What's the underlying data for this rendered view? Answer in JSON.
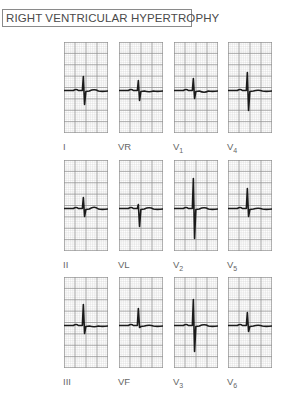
{
  "title": "RIGHT VENTRICULAR HYPERTROPHY",
  "colors": {
    "grid_minor": "#d6d6d6",
    "grid_major": "#8e8e8e",
    "trace": "#1a1a1a",
    "border": "#8a8a8a"
  },
  "layout": {
    "columns_x": [
      64,
      119,
      174,
      228
    ],
    "rows_y": [
      42,
      160,
      277
    ],
    "panel_width": 44,
    "panel_height": 91,
    "label_offset_y": 101
  },
  "leads": [
    {
      "id": "I",
      "label": "I",
      "sub": "",
      "row": 0,
      "col": 0,
      "r": 14,
      "s": 14,
      "t": 2
    },
    {
      "id": "VR",
      "label": "VR",
      "sub": "",
      "row": 0,
      "col": 1,
      "r": 10,
      "s": 10,
      "t": -2
    },
    {
      "id": "V1",
      "label": "V",
      "sub": "1",
      "row": 0,
      "col": 2,
      "r": 12,
      "s": 8,
      "t": -3
    },
    {
      "id": "V4",
      "label": "V",
      "sub": "4",
      "row": 0,
      "col": 3,
      "r": 18,
      "s": 20,
      "t": 1
    },
    {
      "id": "II",
      "label": "II",
      "sub": "",
      "row": 1,
      "col": 0,
      "r": 11,
      "s": 8,
      "t": 3
    },
    {
      "id": "VL",
      "label": "VL",
      "sub": "",
      "row": 1,
      "col": 1,
      "r": 4,
      "s": 18,
      "t": 2
    },
    {
      "id": "V2",
      "label": "V",
      "sub": "2",
      "row": 1,
      "col": 2,
      "r": 30,
      "s": 30,
      "t": 2
    },
    {
      "id": "V5",
      "label": "V",
      "sub": "5",
      "row": 1,
      "col": 3,
      "r": 20,
      "s": 8,
      "t": 1
    },
    {
      "id": "III",
      "label": "III",
      "sub": "",
      "row": 2,
      "col": 0,
      "r": 21,
      "s": 8,
      "t": -2
    },
    {
      "id": "VF",
      "label": "VF",
      "sub": "",
      "row": 2,
      "col": 1,
      "r": 17,
      "s": 2,
      "t": 1
    },
    {
      "id": "V3",
      "label": "V",
      "sub": "3",
      "row": 2,
      "col": 2,
      "r": 26,
      "s": 26,
      "t": 2
    },
    {
      "id": "V6",
      "label": "V",
      "sub": "6",
      "row": 2,
      "col": 3,
      "r": 13,
      "s": 6,
      "t": 1
    }
  ]
}
